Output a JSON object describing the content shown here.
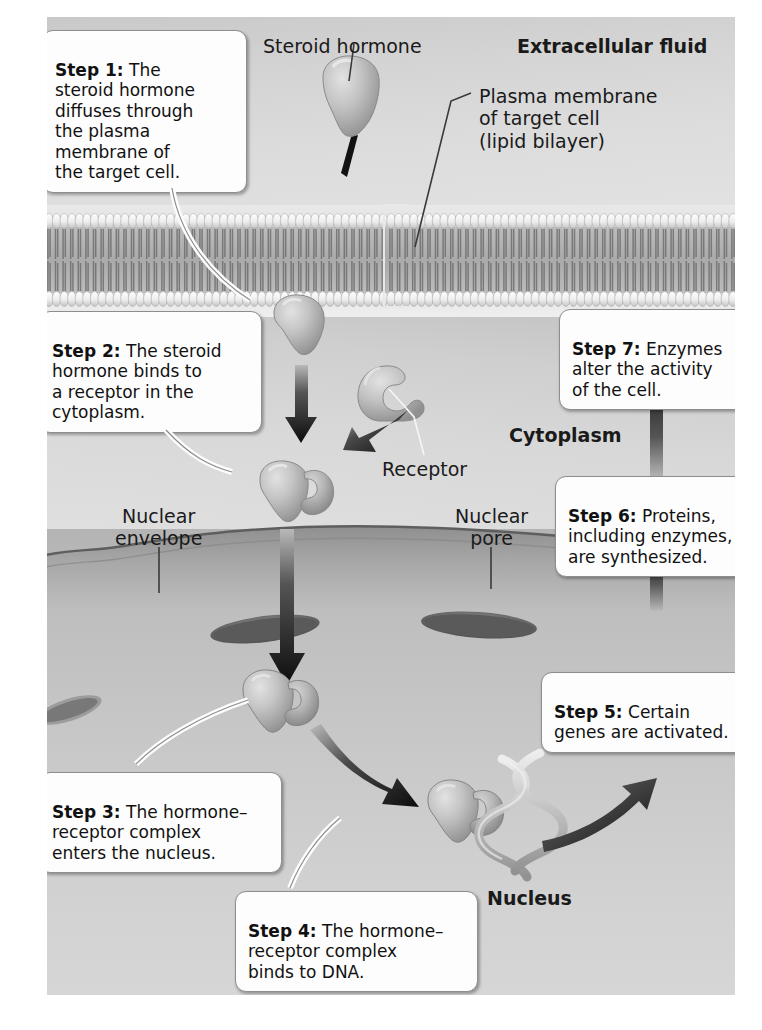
{
  "figure": {
    "regions": {
      "extracellular": "Extracellular fluid",
      "cytoplasm": "Cytoplasm",
      "nucleus": "Nucleus"
    },
    "labels": {
      "steroid_hormone": "Steroid hormone",
      "plasma_membrane": "Plasma membrane\nof target cell\n(lipid bilayer)",
      "receptor": "Receptor",
      "nuclear_envelope": "Nuclear\nenvelope",
      "nuclear_pore": "Nuclear\npore"
    },
    "steps": [
      {
        "id": "step-1",
        "number": "Step 1:",
        "text": " The\nsteroid hormone\ndiffuses through\nthe plasma\nmembrane of\nthe target cell."
      },
      {
        "id": "step-2",
        "number": "Step 2:",
        "text": " The steroid\nhormone binds to\na receptor in the\ncytoplasm."
      },
      {
        "id": "step-3",
        "number": "Step 3:",
        "text": " The hormone–\nreceptor complex\nenters the nucleus."
      },
      {
        "id": "step-4",
        "number": "Step 4:",
        "text": " The hormone–\nreceptor complex\nbinds to DNA."
      },
      {
        "id": "step-5",
        "number": "Step 5:",
        "text": " Certain\ngenes are activated."
      },
      {
        "id": "step-6",
        "number": "Step 6:",
        "text": " Proteins,\nincluding enzymes,\nare synthesized."
      },
      {
        "id": "step-7",
        "number": "Step 7:",
        "text": " Enzymes\nalter the activity\nof the cell."
      }
    ],
    "colors": {
      "extracellular_bg": "#d8d8d8",
      "cytoplasm_bg": "#d2d2d2",
      "nucleus_bg": "#c4c4c4",
      "membrane_head": "#f2f2f2",
      "membrane_tail": "#9a9a9a",
      "molecule_fill": "#b9b9b9",
      "arrow_fill": "#111111",
      "callout_bg": "#fdfdfd",
      "callout_border": "#8e8e8e",
      "text": "#1a1a1a"
    }
  }
}
